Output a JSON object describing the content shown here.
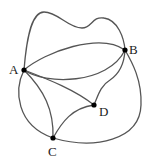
{
  "diagram": {
    "type": "graph",
    "vertices": [
      {
        "id": "A",
        "label": "A",
        "x": 24,
        "y": 70
      },
      {
        "id": "B",
        "label": "B",
        "x": 125,
        "y": 50
      },
      {
        "id": "C",
        "label": "C",
        "x": 53,
        "y": 138
      },
      {
        "id": "D",
        "label": "D",
        "x": 94,
        "y": 105
      }
    ],
    "edges": [
      {
        "from": "A",
        "to": "B",
        "shape": "top-wavy-loop"
      },
      {
        "from": "A",
        "to": "B",
        "shape": "upper-arc"
      },
      {
        "from": "A",
        "to": "B",
        "shape": "lower-arc"
      },
      {
        "from": "A",
        "to": "D"
      },
      {
        "from": "A",
        "to": "C",
        "shape": "inner-arc"
      },
      {
        "from": "A",
        "to": "C",
        "shape": "outer-left-arc"
      },
      {
        "from": "B",
        "to": "D"
      },
      {
        "from": "C",
        "to": "D"
      },
      {
        "from": "C",
        "to": "B",
        "shape": "outer-right-arc"
      }
    ],
    "colors": {
      "edge": "#555555",
      "vertex": "#000000",
      "label": "#222222"
    }
  }
}
